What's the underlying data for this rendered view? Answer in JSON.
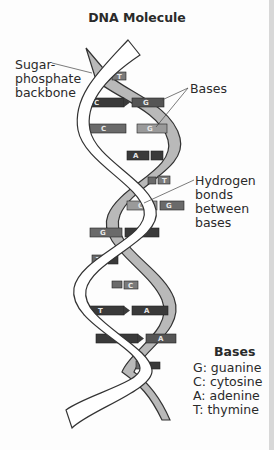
{
  "title": "DNA Molecule",
  "labels": {
    "backbone": [
      "Sugar-",
      "phosphate",
      "backbone"
    ],
    "bases": "Bases",
    "hydrogen_bonds": [
      "Hydrogen",
      "bonds",
      "between",
      "bases"
    ]
  },
  "legend": {
    "title": "Bases",
    "items": [
      {
        "code": "G",
        "name": "guanine",
        "text": "G: guanine"
      },
      {
        "code": "C",
        "name": "cytosine",
        "text": "C: cytosine"
      },
      {
        "code": "A",
        "name": "adenine",
        "text": "A: adenine"
      },
      {
        "code": "T",
        "name": "thymine",
        "text": "T: thymine"
      }
    ]
  },
  "base_pairs": [
    {
      "left": "C",
      "right": "T"
    },
    {
      "left": "C",
      "right": "G"
    },
    {
      "left": "C",
      "right": "G"
    },
    {
      "left": "A",
      "right": "T"
    },
    {
      "left": "C",
      "right": "T"
    },
    {
      "left": "C",
      "right": "G"
    },
    {
      "left": "G",
      "right": "C"
    },
    {
      "left": "T",
      "right": "A"
    },
    {
      "left": "C",
      "right": "C"
    },
    {
      "left": "T",
      "right": "A"
    },
    {
      "left": "T",
      "right": "A"
    },
    {
      "left": "C",
      "right": "T"
    }
  ],
  "colors": {
    "backbone_front": "#ffffff",
    "backbone_back": "#b8b8b8",
    "outline": "#333333",
    "base_dark": "#3a3a3a",
    "base_mid": "#6a6a6a",
    "base_light": "#9a9a9a"
  }
}
